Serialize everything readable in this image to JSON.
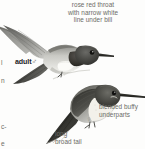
{
  "plate": {
    "kind": "field-guide-illustration",
    "subject": "hummingbird",
    "background_color": "#fdfdfc",
    "text_color": "#6b6b66",
    "label_color": "#23231f",
    "art_style": "grayscale-halftone"
  },
  "annotations": {
    "throat": {
      "line1": "rose red throat",
      "line2": "with narrow white",
      "line3": "line under bill"
    },
    "underparts": {
      "line1": "blended buffy",
      "line2": "underparts"
    },
    "tail": {
      "line1": "long",
      "line2": "broad tail"
    }
  },
  "labels": {
    "adult_male": "adult",
    "male_symbol": "♂",
    "female_symbol": "♀"
  },
  "edge_fragments": {
    "frag_l": "l",
    "frag_n": "n",
    "frag_c": "c-",
    "frag_e": "e"
  }
}
